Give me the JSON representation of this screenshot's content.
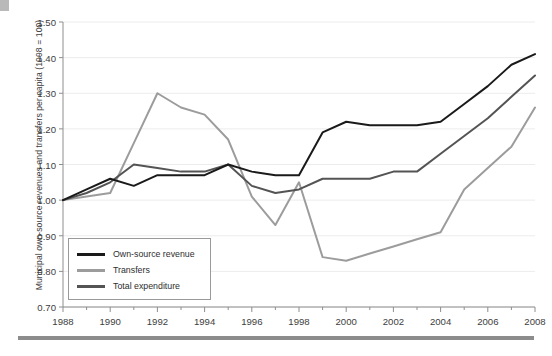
{
  "axes": {
    "y_title": "Municipal own-source revenues and transfers per capita (1998 = 100)",
    "y_ticks": [
      "1.50",
      "1.40",
      "1.30",
      "1.20",
      "1.10",
      "1.00",
      "0.90",
      "0.80",
      "0.70"
    ],
    "x_ticks": [
      "1988",
      "1990",
      "1992",
      "1994",
      "1996",
      "1998",
      "2000",
      "2002",
      "2004",
      "2006",
      "2008"
    ]
  },
  "legend": {
    "items": [
      {
        "label": "Own-source revenue",
        "color": "#1a1a1a"
      },
      {
        "label": "Transfers",
        "color": "#9c9c9c"
      },
      {
        "label": "Total expenditure",
        "color": "#545454"
      }
    ]
  },
  "chart_data": {
    "type": "line",
    "title": "",
    "xlabel": "",
    "ylabel": "Municipal own-source revenues and transfers per capita (1998 = 100)",
    "xlim": [
      1988,
      2008
    ],
    "ylim": [
      0.7,
      1.5
    ],
    "ytick_step": 0.1,
    "xtick_step": 2,
    "minor_xticks": true,
    "grid": "horizontal-faint",
    "legend_position": "lower-left-inside",
    "x": [
      1988,
      1989,
      1990,
      1991,
      1992,
      1993,
      1994,
      1995,
      1996,
      1997,
      1998,
      1999,
      2000,
      2001,
      2002,
      2003,
      2004,
      2005,
      2006,
      2007,
      2008
    ],
    "series": [
      {
        "name": "Own-source revenue",
        "color": "#1a1a1a",
        "values": [
          1.0,
          1.03,
          1.06,
          1.04,
          1.07,
          1.07,
          1.07,
          1.1,
          1.08,
          1.07,
          1.07,
          1.19,
          1.22,
          1.21,
          1.21,
          1.21,
          1.22,
          1.27,
          1.32,
          1.38,
          1.41
        ]
      },
      {
        "name": "Transfers",
        "color": "#9c9c9c",
        "values": [
          1.0,
          1.01,
          1.02,
          1.16,
          1.3,
          1.26,
          1.24,
          1.17,
          1.01,
          0.93,
          1.05,
          0.84,
          0.83,
          0.85,
          0.87,
          0.89,
          0.91,
          1.03,
          1.09,
          1.15,
          1.26
        ]
      },
      {
        "name": "Total expenditure",
        "color": "#545454",
        "values": [
          1.0,
          1.02,
          1.05,
          1.1,
          1.09,
          1.08,
          1.08,
          1.1,
          1.04,
          1.02,
          1.03,
          1.06,
          1.06,
          1.06,
          1.08,
          1.08,
          1.13,
          1.18,
          1.23,
          1.29,
          1.35
        ]
      }
    ]
  }
}
